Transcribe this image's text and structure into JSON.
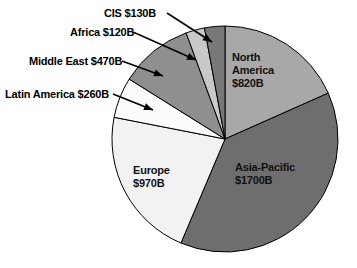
{
  "chart_data": {
    "type": "pie",
    "title": "",
    "units": "Billions of US dollars",
    "total": 4470,
    "categories": [
      "North America",
      "Asia-Pacific",
      "Europe",
      "Latin America",
      "Middle East",
      "Africa",
      "CIS"
    ],
    "values": [
      820,
      1700,
      970,
      260,
      470,
      120,
      130
    ],
    "value_labels": [
      "$820B",
      "$1700B",
      "$970B",
      "$260B",
      "$470B",
      "$120B",
      "$130B"
    ],
    "start_angle_deg": 0,
    "direction": "clockwise",
    "legend": "none",
    "grid": false,
    "slices": [
      {
        "name": "North America",
        "value": 820,
        "value_label": "$820B",
        "label_text": "North America $820B",
        "label_lines": [
          "North",
          "America",
          "$820B"
        ],
        "label_placement": "inside",
        "color": "#a8a8a8",
        "start_deg": 0,
        "end_deg": 66.04
      },
      {
        "name": "Asia-Pacific",
        "value": 1700,
        "value_label": "$1700B",
        "label_text": "Asia-Pacific $1700B",
        "label_lines": [
          "Asia-Pacific",
          "$1700B"
        ],
        "label_placement": "inside",
        "color": "#6e6e6e",
        "start_deg": 66.04,
        "end_deg": 202.95
      },
      {
        "name": "Europe",
        "value": 970,
        "value_label": "$970B",
        "label_text": "Europe $970B",
        "label_lines": [
          "Europe",
          "$970B"
        ],
        "label_placement": "inside",
        "color": "#f2f2f2",
        "start_deg": 202.95,
        "end_deg": 281.07
      },
      {
        "name": "Latin America",
        "value": 260,
        "value_label": "$260B",
        "label_text": "Latin America $260B",
        "label_lines": [
          "Latin America $260B"
        ],
        "label_placement": "callout",
        "color": "#fbfbfb",
        "start_deg": 281.07,
        "end_deg": 302.01
      },
      {
        "name": "Middle East",
        "value": 470,
        "value_label": "$470B",
        "label_text": "Middle East $470B",
        "label_lines": [
          "Middle East $470B"
        ],
        "label_placement": "callout",
        "color": "#8f8f8f",
        "start_deg": 302.01,
        "end_deg": 339.87
      },
      {
        "name": "Africa",
        "value": 120,
        "value_label": "$120B",
        "label_text": "Africa $120B",
        "label_lines": [
          "Africa $120B"
        ],
        "label_placement": "callout",
        "color": "#c9c9c9",
        "start_deg": 339.87,
        "end_deg": 349.54
      },
      {
        "name": "CIS",
        "value": 130,
        "value_label": "$130B",
        "label_text": "CIS $130B",
        "label_lines": [
          "CIS $130B"
        ],
        "label_placement": "callout",
        "color": "#787878",
        "start_deg": 349.54,
        "end_deg": 360
      }
    ],
    "callouts": [
      {
        "name": "CIS",
        "text": "CIS $130B"
      },
      {
        "name": "Africa",
        "text": "Africa $120B"
      },
      {
        "name": "Middle East",
        "text": "Middle East $470B"
      },
      {
        "name": "Latin America",
        "text": "Latin America $260B"
      }
    ],
    "geometry": {
      "center_x": 225,
      "center_y": 139,
      "radius": 113,
      "outline_color": "#000000"
    }
  },
  "labels": {
    "cis": "CIS $130B",
    "africa": "Africa $120B",
    "middle_east": "Middle East $470B",
    "latin_america": "Latin America $260B",
    "north_america_line1": "North",
    "north_america_line2": "America",
    "north_america_line3": "$820B",
    "asia_pacific_line1": "Asia-Pacific",
    "asia_pacific_line2": "$1700B",
    "europe_line1": "Europe",
    "europe_line2": "$970B"
  }
}
